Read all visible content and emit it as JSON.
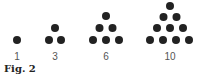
{
  "figure": {
    "caption": "Fig. 2",
    "dot_color": "#222222",
    "groups": [
      {
        "label": "1",
        "count": 1,
        "dots": [
          [
            17,
            40
          ]
        ],
        "label_pos": [
          17,
          60
        ]
      },
      {
        "label": "3",
        "count": 3,
        "dots": [
          [
            55,
            28
          ],
          [
            49,
            40
          ],
          [
            61,
            40
          ]
        ],
        "label_pos": [
          55,
          60
        ]
      },
      {
        "label": "6",
        "count": 6,
        "dots": [
          [
            106,
            16
          ],
          [
            99.5,
            28
          ],
          [
            112.5,
            28
          ],
          [
            93,
            40
          ],
          [
            106,
            40
          ],
          [
            119,
            40
          ]
        ],
        "label_pos": [
          106,
          60
        ]
      },
      {
        "label": "10",
        "count": 10,
        "dots": [
          [
            170,
            6
          ],
          [
            163.5,
            17
          ],
          [
            176.5,
            17
          ],
          [
            157,
            28
          ],
          [
            170,
            28
          ],
          [
            183,
            28
          ],
          [
            150,
            40
          ],
          [
            163,
            40
          ],
          [
            176,
            40
          ],
          [
            189,
            40
          ]
        ],
        "label_pos": [
          170,
          60
        ]
      }
    ]
  }
}
